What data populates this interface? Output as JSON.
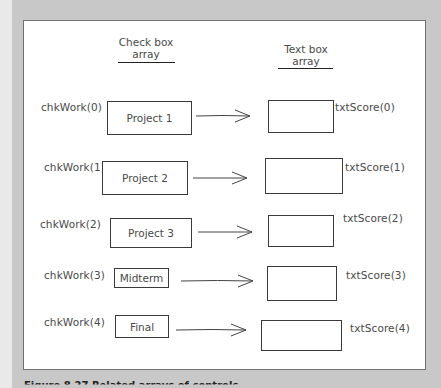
{
  "headers": {
    "checkbox_array": {
      "line1": "Check box",
      "line2": "array"
    },
    "textbox_array": {
      "line1": "Text box",
      "line2": "array"
    }
  },
  "rows": [
    {
      "chk_name": "chkWork(0)",
      "chk_label": "Project 1",
      "txt_name": "txtScore(0)"
    },
    {
      "chk_name": "chkWork(1)",
      "chk_label": "Project 2",
      "txt_name": "txtScore(1)"
    },
    {
      "chk_name": "chkWork(2)",
      "chk_label": "Project 3",
      "txt_name": "txtScore(2)"
    },
    {
      "chk_name": "chkWork(3)",
      "chk_label": "Midterm",
      "txt_name": "txtScore(3)"
    },
    {
      "chk_name": "chkWork(4)",
      "chk_label": "Final",
      "txt_name": "txtScore(4)"
    }
  ],
  "caption": "Figure 8.27 Related arrays of controls"
}
